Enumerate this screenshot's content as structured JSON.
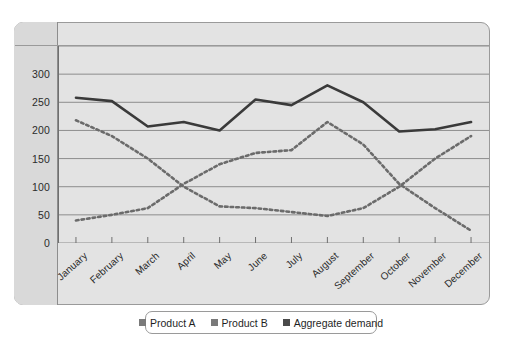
{
  "chart_data": {
    "type": "line",
    "title": "",
    "xlabel": "",
    "ylabel": "",
    "ylim": [
      0,
      350
    ],
    "yticks": [
      0,
      50,
      100,
      150,
      200,
      250,
      300
    ],
    "gridlines": [
      0,
      50,
      100,
      150,
      200,
      250,
      300,
      350
    ],
    "grid": true,
    "legend_position": "bottom",
    "categories": [
      "January",
      "February",
      "March",
      "April",
      "May",
      "June",
      "July",
      "August",
      "September",
      "October",
      "November",
      "December"
    ],
    "series": [
      {
        "name": "Product A",
        "style": "dotted",
        "color": "#6b6b6b",
        "values": [
          218,
          190,
          150,
          100,
          65,
          62,
          55,
          48,
          62,
          100,
          150,
          190
        ]
      },
      {
        "name": "Product B",
        "style": "dotted",
        "color": "#6b6b6b",
        "values": [
          40,
          50,
          62,
          105,
          140,
          160,
          165,
          215,
          175,
          105,
          62,
          22
        ]
      },
      {
        "name": "Aggregate demand",
        "style": "solid",
        "color": "#3a3a3a",
        "values": [
          258,
          252,
          207,
          215,
          200,
          255,
          245,
          280,
          250,
          198,
          202,
          215
        ]
      }
    ]
  },
  "legend": {
    "items": [
      {
        "label": "Product A",
        "color": "#7a7a7a"
      },
      {
        "label": "Product B",
        "color": "#7a7a7a"
      },
      {
        "label": "Aggregate demand",
        "color": "#4a4a4a"
      }
    ]
  },
  "colors": {
    "panel_background": "#e3e3e3",
    "rail_background": "#d9d9d9",
    "grid": "#8d8d8d",
    "border": "#9a9a9a",
    "text": "#2b2b2b"
  }
}
